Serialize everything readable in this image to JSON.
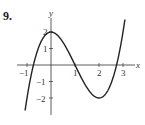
{
  "problem_number": "9.",
  "chart_data": {
    "type": "line",
    "title": "",
    "xlabel": "x",
    "ylabel": "y",
    "x_ticks": [
      -1,
      1,
      2,
      3
    ],
    "x_tick_labels": [
      "−1",
      "1",
      "2",
      "3"
    ],
    "y_ticks": [
      2,
      1,
      -1,
      -2
    ],
    "y_tick_labels": [
      "2",
      "1",
      "−1",
      "−2"
    ],
    "xlim": [
      -1.3,
      3.4
    ],
    "ylim": [
      -2.9,
      2.9
    ],
    "grid": false,
    "legend": null,
    "series": [
      {
        "name": "curve",
        "description": "cubic with local max (0,2) and local min (2,-2), y = x^3 - 3x^2 + 2",
        "x": [
          -1.0,
          -0.75,
          -0.5,
          -0.25,
          0,
          0.25,
          0.5,
          0.75,
          1.0,
          1.25,
          1.5,
          1.75,
          2.0,
          2.25,
          2.5,
          2.75,
          3.0
        ],
        "y": [
          -2.0,
          -0.11,
          1.13,
          1.8,
          2.0,
          1.83,
          1.38,
          0.73,
          0.0,
          -0.73,
          -1.38,
          -1.83,
          -2.0,
          -1.8,
          -1.13,
          0.11,
          2.0
        ]
      }
    ],
    "key_points": [
      {
        "label": "local max",
        "x": 0,
        "y": 2
      },
      {
        "label": "inflection / root",
        "x": 1,
        "y": 0
      },
      {
        "label": "local min",
        "x": 2,
        "y": -2
      }
    ]
  }
}
